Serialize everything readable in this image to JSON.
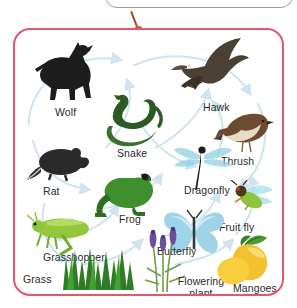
{
  "diagram": {
    "type": "food-web",
    "frame_color": "#e4566c",
    "callout_border_color": "#9c9c9c",
    "connector_dot_color": "#d6542f",
    "arrow_color": "#cfe4ef",
    "background": "#ffffff",
    "nodes": [
      {
        "id": "wolf",
        "label": "Wolf",
        "icon": "wolf-icon",
        "color": "#1d1d1d",
        "trophic": "tertiary-consumer"
      },
      {
        "id": "hawk",
        "label": "Hawk",
        "icon": "hawk-icon",
        "color": "#4a4034",
        "trophic": "tertiary-consumer"
      },
      {
        "id": "snake",
        "label": "Snake",
        "icon": "snake-icon",
        "color": "#2d5a24",
        "trophic": "secondary-consumer"
      },
      {
        "id": "thrush",
        "label": "Thrush",
        "icon": "thrush-icon",
        "color": "#6d4b33",
        "trophic": "secondary-consumer"
      },
      {
        "id": "rat",
        "label": "Rat",
        "icon": "rat-icon",
        "color": "#2a2a2a",
        "trophic": "primary-consumer"
      },
      {
        "id": "dragonfly",
        "label": "Dragonfly",
        "icon": "dragonfly-icon",
        "color": "#7fc4d8",
        "trophic": "secondary-consumer"
      },
      {
        "id": "frog",
        "label": "Frog",
        "icon": "frog-icon",
        "color": "#3f8f2e",
        "trophic": "secondary-consumer"
      },
      {
        "id": "fruitfly",
        "label": "Fruit fly",
        "icon": "fruit-fly-icon",
        "color": "#8cc63f",
        "trophic": "primary-consumer"
      },
      {
        "id": "grasshopper",
        "label": "Grasshopper",
        "icon": "grasshopper-icon",
        "color": "#93c83d",
        "trophic": "primary-consumer"
      },
      {
        "id": "butterfly",
        "label": "Butterfly",
        "icon": "butterfly-icon",
        "color": "#9fd4e8",
        "trophic": "primary-consumer"
      },
      {
        "id": "grass",
        "label": "Grass",
        "icon": "grass-icon",
        "color": "#2e7d26",
        "trophic": "producer"
      },
      {
        "id": "flowering",
        "label": "Flowering plant",
        "icon": "flowering-plant-icon",
        "color": "#7b5ea7",
        "trophic": "producer"
      },
      {
        "id": "mangoes",
        "label": "Mangoes",
        "icon": "mango-icon",
        "color": "#f2c230",
        "trophic": "producer"
      }
    ]
  }
}
